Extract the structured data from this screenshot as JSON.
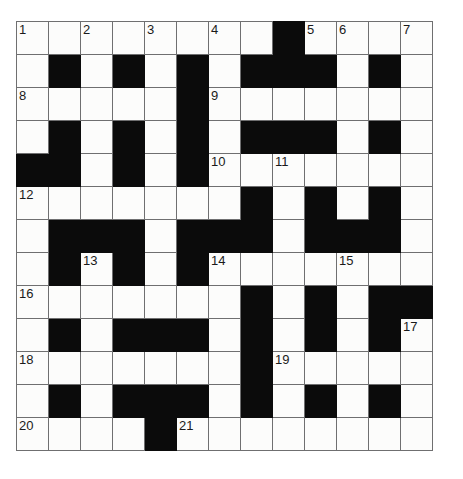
{
  "puzzle": {
    "title": "Crossword Grid",
    "rows": 13,
    "cols": 13,
    "cell_size_px": 33,
    "colors": {
      "block": "#0b0b0b",
      "cell": "#fcfcfb",
      "grid_line": "#6f6f70",
      "number": "#1a1a1a",
      "page_background": "#ffffff"
    },
    "legend": {
      "white_cell": "open letter square",
      "black_cell": "blocked square"
    },
    "clue_numbers": [
      1,
      2,
      3,
      4,
      5,
      6,
      7,
      8,
      9,
      10,
      11,
      12,
      13,
      14,
      15,
      16,
      17,
      18,
      19,
      20,
      21
    ],
    "numbered_cells": [
      {
        "number": "1",
        "row": 0,
        "col": 0
      },
      {
        "number": "2",
        "row": 0,
        "col": 2
      },
      {
        "number": "3",
        "row": 0,
        "col": 4
      },
      {
        "number": "4",
        "row": 0,
        "col": 6
      },
      {
        "number": "5",
        "row": 0,
        "col": 9
      },
      {
        "number": "6",
        "row": 0,
        "col": 10
      },
      {
        "number": "7",
        "row": 0,
        "col": 12
      },
      {
        "number": "8",
        "row": 2,
        "col": 0
      },
      {
        "number": "9",
        "row": 2,
        "col": 6
      },
      {
        "number": "10",
        "row": 4,
        "col": 6
      },
      {
        "number": "11",
        "row": 4,
        "col": 8
      },
      {
        "number": "12",
        "row": 5,
        "col": 0
      },
      {
        "number": "13",
        "row": 7,
        "col": 2
      },
      {
        "number": "14",
        "row": 7,
        "col": 6
      },
      {
        "number": "15",
        "row": 7,
        "col": 10
      },
      {
        "number": "16",
        "row": 8,
        "col": 0
      },
      {
        "number": "17",
        "row": 9,
        "col": 12
      },
      {
        "number": "18",
        "row": 10,
        "col": 0
      },
      {
        "number": "19",
        "row": 10,
        "col": 8
      },
      {
        "number": "20",
        "row": 12,
        "col": 0
      },
      {
        "number": "21",
        "row": 12,
        "col": 5
      }
    ],
    "grid": [
      [
        0,
        0,
        0,
        0,
        0,
        0,
        0,
        0,
        1,
        0,
        0,
        0,
        0
      ],
      [
        0,
        1,
        0,
        1,
        0,
        1,
        0,
        1,
        1,
        1,
        0,
        1,
        0
      ],
      [
        0,
        0,
        0,
        0,
        0,
        1,
        0,
        0,
        0,
        0,
        0,
        0,
        0
      ],
      [
        0,
        1,
        0,
        1,
        0,
        1,
        0,
        1,
        1,
        1,
        0,
        1,
        0
      ],
      [
        1,
        1,
        0,
        1,
        0,
        1,
        0,
        0,
        0,
        0,
        0,
        0,
        0
      ],
      [
        0,
        0,
        0,
        0,
        0,
        0,
        0,
        1,
        0,
        1,
        0,
        1,
        0
      ],
      [
        0,
        1,
        1,
        1,
        0,
        1,
        1,
        1,
        0,
        1,
        1,
        1,
        0
      ],
      [
        0,
        1,
        0,
        1,
        0,
        1,
        0,
        0,
        0,
        0,
        0,
        0,
        0
      ],
      [
        0,
        0,
        0,
        0,
        0,
        0,
        0,
        1,
        0,
        1,
        0,
        1,
        1
      ],
      [
        0,
        1,
        0,
        1,
        1,
        1,
        0,
        1,
        0,
        1,
        0,
        1,
        0
      ],
      [
        0,
        0,
        0,
        0,
        0,
        0,
        0,
        1,
        0,
        0,
        0,
        0,
        0
      ],
      [
        0,
        1,
        0,
        1,
        1,
        1,
        0,
        1,
        0,
        1,
        0,
        1,
        0
      ],
      [
        0,
        0,
        0,
        0,
        1,
        0,
        0,
        0,
        0,
        0,
        0,
        0,
        0
      ]
    ]
  }
}
